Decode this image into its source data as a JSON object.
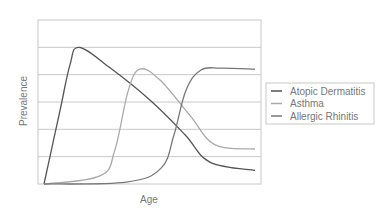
{
  "chart_data": {
    "type": "line",
    "title": "",
    "xlabel": "Age",
    "ylabel": "Prevalence",
    "xlim": [
      0,
      100
    ],
    "ylim": [
      0,
      6
    ],
    "grid": {
      "horizontal": true,
      "vertical": false,
      "count": 6
    },
    "x_ticks_shown": false,
    "y_ticks_shown": false,
    "legend_position": "right",
    "series": [
      {
        "name": "Atopic Dermatitis",
        "color": "#555555",
        "points": [
          [
            2.7,
            0
          ],
          [
            9.9,
            2.7
          ],
          [
            14.3,
            4.35
          ],
          [
            18.4,
            5.0
          ],
          [
            32.3,
            4.25
          ],
          [
            50.2,
            3.07
          ],
          [
            65.9,
            1.8
          ],
          [
            77.1,
            0.8
          ],
          [
            97.3,
            0.5
          ]
        ]
      },
      {
        "name": "Asthma",
        "color": "#aaaaaa",
        "points": [
          [
            2.7,
            0
          ],
          [
            27.8,
            0.3
          ],
          [
            34.5,
            1.25
          ],
          [
            40.4,
            3.4
          ],
          [
            45.7,
            4.2
          ],
          [
            54.7,
            3.8
          ],
          [
            68.2,
            2.5
          ],
          [
            79.4,
            1.43
          ],
          [
            97.3,
            1.28
          ]
        ]
      },
      {
        "name": "Allergic Rhinitis",
        "color": "#777777",
        "points": [
          [
            2.7,
            0
          ],
          [
            39.5,
            0.07
          ],
          [
            55.2,
            0.58
          ],
          [
            61.0,
            1.8
          ],
          [
            66.4,
            3.44
          ],
          [
            73.1,
            4.17
          ],
          [
            82.1,
            4.24
          ],
          [
            97.3,
            4.2
          ]
        ]
      }
    ]
  }
}
